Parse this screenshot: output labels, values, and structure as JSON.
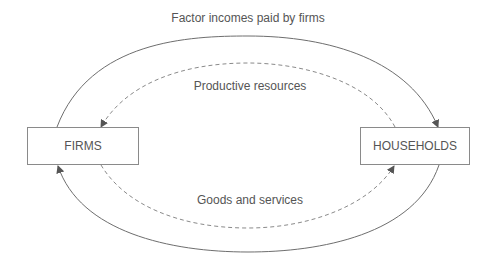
{
  "diagram": {
    "nodes": {
      "firms": "FIRMS",
      "households": "HOUSEHOLDS"
    },
    "flows": {
      "outer_top": "Factor incomes paid by firms",
      "inner_top": "Productive resources",
      "inner_bottom": "Goods and services"
    },
    "colors": {
      "line": "#6e6e6e",
      "text": "#555555",
      "box_border": "#8a8a8a"
    }
  }
}
